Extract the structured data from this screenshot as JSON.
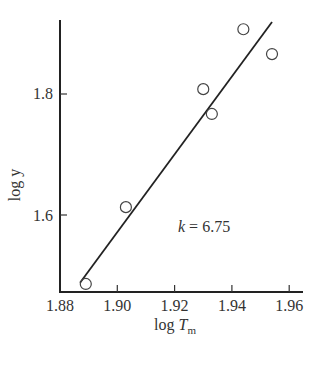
{
  "chart_data": {
    "type": "scatter",
    "title": "",
    "xlabel": "log T_m",
    "ylabel": "log y",
    "xlim": [
      1.88,
      1.965
    ],
    "ylim": [
      1.47,
      1.93
    ],
    "x_ticks": [
      "1.88",
      "1.90",
      "1.92",
      "1.94",
      "1.96"
    ],
    "y_ticks": [
      "1.6",
      "1.8"
    ],
    "grid": false,
    "series": [
      {
        "name": "data",
        "marker": "open-circle",
        "x": [
          1.889,
          1.903,
          1.93,
          1.933,
          1.944,
          1.954
        ],
        "y": [
          1.486,
          1.613,
          1.808,
          1.767,
          1.907,
          1.866
        ]
      },
      {
        "name": "fit",
        "type": "line",
        "x": [
          1.887,
          1.954
        ],
        "y": [
          1.488,
          1.919
        ]
      }
    ],
    "annotations": [
      {
        "text": "k = 6.75",
        "x": 1.92,
        "y": 1.58
      }
    ]
  },
  "labels": {
    "xlabel_main": "log ",
    "xlabel_var": "T",
    "xlabel_sub": "m",
    "ylabel": "log y",
    "annotation_k": "k",
    "annotation_rest": " = 6.75"
  }
}
